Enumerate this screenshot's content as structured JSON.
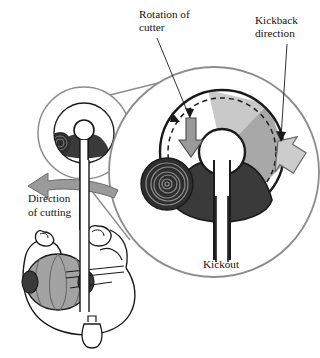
{
  "figure": {
    "type": "safety-instruction-diagram",
    "background_color": "#ffffff"
  },
  "labels": {
    "rotation": {
      "line1": "Rotation of",
      "line2": "cutter"
    },
    "kickback": {
      "line1": "Kickback",
      "line2": "direction"
    },
    "cutting": {
      "line1": "Direction",
      "line2": "of cutting"
    },
    "kickout": {
      "text": "Kickout"
    }
  },
  "colors": {
    "outline": "#1a1a1a",
    "magnifier_ring": "#8c8c8c",
    "blade_sector_light": "#c9c9c9",
    "blade_sector_mid": "#a8a8a8",
    "guard_dark": "#3a3a3a",
    "arrow_gray": "#9a9a9a",
    "arrow_light": "#cccccc",
    "helmet_gray": "#a3a3a3",
    "log_dark": "#2e2e2e",
    "white": "#ffffff"
  },
  "elements": {
    "inset_view": "small-scale view of cutter head",
    "magnified_view": "enlarged view of cutter head",
    "cutter_disc": "circular saw blade with shaded hazard sectors",
    "dashed_circle": "dashed blade rim indicating rotation path",
    "hub": "blade hub / arbor",
    "guard": "dark blade guard shoe",
    "shaft": "tool shaft",
    "log": "cut log end with growth rings",
    "operator": "overhead view of operator holding pole tool",
    "rotation_arrow": "downward arrow showing blade rotation",
    "kickback_arrow": "thick arrow showing kickback direction",
    "cutting_arrow": "curved arrow showing sweep direction of cutting"
  }
}
